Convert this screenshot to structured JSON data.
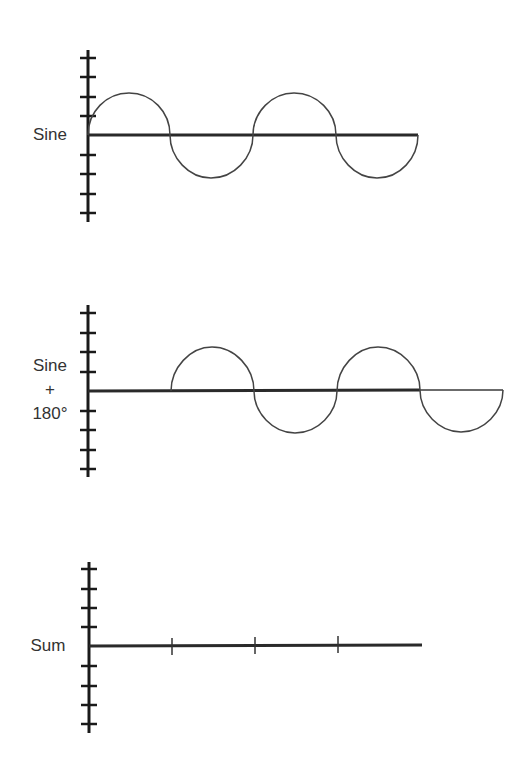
{
  "diagram": {
    "panels": [
      {
        "id": "sine",
        "label_lines": [
          "Sine"
        ],
        "description": "Sine wave starting at phase 0",
        "wave": "sine"
      },
      {
        "id": "sine-180",
        "label_lines": [
          "Sine",
          "+",
          "180°"
        ],
        "description": "Sine wave shifted by 180 degrees",
        "wave": "sine-shifted-180"
      },
      {
        "id": "sum",
        "label_lines": [
          "Sum"
        ],
        "description": "Sum of the two waves is a flat line (zero)",
        "wave": "flat"
      }
    ],
    "y_axis_ticks_per_side": 4,
    "colors": {
      "axis": "#1a1a1a",
      "wave": "#444444",
      "text": "#333333",
      "background": "#ffffff"
    }
  }
}
